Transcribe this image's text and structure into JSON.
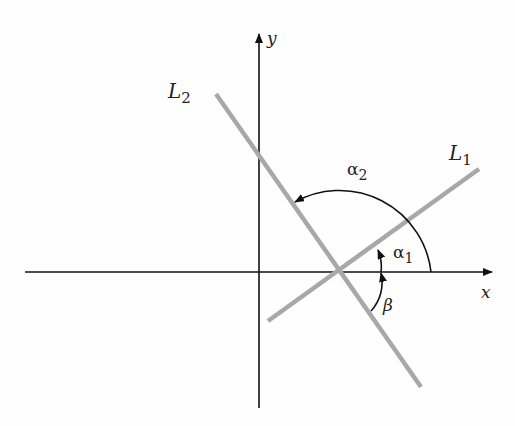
{
  "diagram": {
    "axes": {
      "x_label": "x",
      "y_label": "y"
    },
    "lines": [
      {
        "name": "L1",
        "label": "L",
        "subscript": "1"
      },
      {
        "name": "L2",
        "label": "L",
        "subscript": "2"
      }
    ],
    "angles": [
      {
        "name": "alpha1",
        "symbol": "α",
        "subscript": "1"
      },
      {
        "name": "alpha2",
        "symbol": "α",
        "subscript": "2"
      },
      {
        "name": "beta",
        "symbol": "β"
      }
    ],
    "colors": {
      "axis": "#111111",
      "line": "#a8a8a8",
      "arc": "#111111"
    }
  }
}
